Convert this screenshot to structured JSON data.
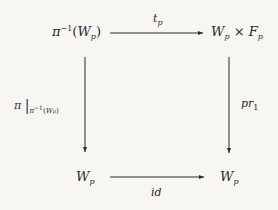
{
  "diagram": {
    "type": "commutative-square",
    "nodes": {
      "top_left": {
        "base": "π",
        "sup": "−1",
        "paren_open": "(",
        "main": "W",
        "sub": "p",
        "paren_close": ")"
      },
      "top_right": {
        "a": "W",
        "a_sub": "p",
        "times": "×",
        "b": "F",
        "b_sub": "p"
      },
      "bottom_left": {
        "main": "W",
        "sub": "p"
      },
      "bottom_right": {
        "main": "W",
        "sub": "p"
      }
    },
    "arrows": {
      "top": {
        "label": "t",
        "label_sub": "p"
      },
      "bottom": {
        "label": "id"
      },
      "left": {
        "label": "π",
        "bar": "|",
        "restrict": "π",
        "restrict_sup": "−1",
        "restrict_open": "(",
        "restrict_main": "W",
        "restrict_sub": "p",
        "restrict_close": ")"
      },
      "right": {
        "label": "pr",
        "label_sub": "1"
      }
    },
    "colors": {
      "background": "#f7f6f2",
      "ink": "#2a2a2a"
    }
  }
}
